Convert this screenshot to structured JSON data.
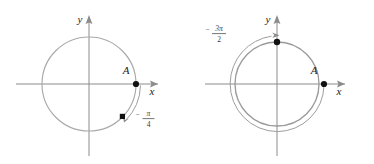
{
  "figure": {
    "panel_count": 2,
    "background_color": "#ffffff",
    "stroke_color": "#a9a9a9",
    "point_color": "#111111",
    "label_color": "#1a1a1a"
  },
  "panels": [
    {
      "id": "left",
      "name": "negative-pi-over-four",
      "axis_x_label": "x",
      "axis_y_label": "y",
      "initial_point_label": "A",
      "angle_label": {
        "sign": "−",
        "numerator": "π",
        "denominator": "4",
        "full": "−π/4"
      },
      "angle_radians": -0.7853981634,
      "direction": "clockwise",
      "initial_point": {
        "x": 1,
        "y": 0
      },
      "terminal_point": {
        "x": 0.7071,
        "y": -0.7071
      },
      "terminal_marker": "square",
      "initial_marker": "circle",
      "circle_count": 1
    },
    {
      "id": "right",
      "name": "negative-three-pi-over-two",
      "axis_x_label": "x",
      "axis_y_label": "y",
      "initial_point_label": "A",
      "angle_label": {
        "sign": "−",
        "numerator": "3π",
        "denominator": "2",
        "full": "−3π/2"
      },
      "angle_radians": -4.7123889804,
      "direction": "clockwise",
      "initial_point": {
        "x": 1,
        "y": 0
      },
      "terminal_point": {
        "x": 0,
        "y": 1
      },
      "terminal_marker": "circle",
      "initial_marker": "circle",
      "circle_count": 1
    }
  ]
}
